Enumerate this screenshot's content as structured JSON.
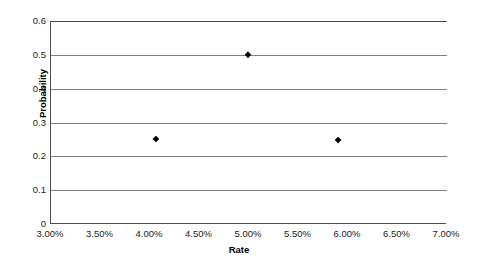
{
  "chart_data": {
    "type": "scatter",
    "title": "",
    "xlabel": "Rate",
    "ylabel": "Probability",
    "xlim": [
      3.0,
      7.0
    ],
    "ylim": [
      0,
      0.6
    ],
    "grid": "horizontal",
    "legend": "none",
    "x_tick_labels": [
      "3.00%",
      "3.50%",
      "4.00%",
      "4.50%",
      "5.00%",
      "5.50%",
      "6.00%",
      "6.50%",
      "7.00%"
    ],
    "x_tick_values": [
      3.0,
      3.5,
      4.0,
      4.5,
      5.0,
      5.5,
      6.0,
      6.5,
      7.0
    ],
    "y_tick_labels": [
      "0",
      "0.1",
      "0.2",
      "0.3",
      "0.4",
      "0.5",
      "0.6"
    ],
    "y_tick_values": [
      0,
      0.1,
      0.2,
      0.3,
      0.4,
      0.5,
      0.6
    ],
    "series": [
      {
        "name": "Probability",
        "marker": "diamond",
        "color": "#000000",
        "points": [
          {
            "x": 4.07,
            "y": 0.251
          },
          {
            "x": 5.0,
            "y": 0.5
          },
          {
            "x": 5.91,
            "y": 0.248
          }
        ]
      }
    ]
  },
  "colors": {
    "axis": "#4d4d4d",
    "gridline": "#808080",
    "marker": "#000000",
    "background": "#ffffff",
    "text": "#1a1a1a"
  }
}
